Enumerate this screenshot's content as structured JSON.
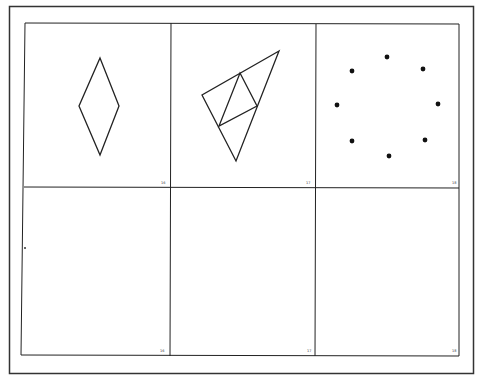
{
  "page": {
    "colors": {
      "background": "#ffffff",
      "line": "#222222",
      "frame": "#333333"
    }
  },
  "panels": {
    "top": [
      {
        "number": "16",
        "figure": "rhombus"
      },
      {
        "number": "17",
        "figure": "subdivided-triangle"
      },
      {
        "number": "18",
        "figure": "circle-of-dots",
        "dot_count": 8
      }
    ],
    "bottom": [
      {
        "number": "16",
        "figure": "blank"
      },
      {
        "number": "17",
        "figure": "blank"
      },
      {
        "number": "18",
        "figure": "blank"
      }
    ]
  }
}
